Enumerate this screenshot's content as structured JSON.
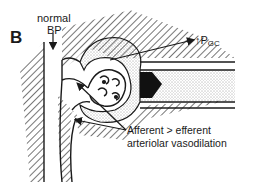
{
  "panel_label": "B",
  "labels": {
    "bp_line1": "normal",
    "bp_line2": "BP",
    "pgc_arrow": "↑",
    "pgc_main": "P",
    "pgc_sub": "GC",
    "caption_line1": "Afferent  > efferent",
    "caption_line2": "arteriolar vasodilation"
  },
  "colors": {
    "ink": "#1a1a1a",
    "paper": "#ffffff"
  },
  "structures": [
    "afferent-arteriole",
    "efferent-arteriole",
    "glomerulus",
    "bowmans-capsule",
    "proximal-tubule",
    "interstitium"
  ]
}
